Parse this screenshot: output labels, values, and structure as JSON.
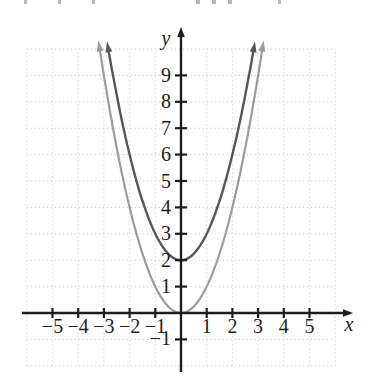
{
  "chart_data": {
    "type": "line",
    "title": "",
    "xlabel": "x",
    "ylabel": "y",
    "xlim": [
      -6,
      6
    ],
    "ylim": [
      -2,
      10
    ],
    "grid": true,
    "grid_color": "#d2d4d1",
    "axis_color": "#1e1e1e",
    "legend": null,
    "x_ticks": [
      {
        "v": -5,
        "label": "−5"
      },
      {
        "v": -4,
        "label": "−4"
      },
      {
        "v": -3,
        "label": "−3"
      },
      {
        "v": -2,
        "label": "−2"
      },
      {
        "v": -1,
        "label": "−1"
      },
      {
        "v": 1,
        "label": "1"
      },
      {
        "v": 2,
        "label": "2"
      },
      {
        "v": 3,
        "label": "3"
      },
      {
        "v": 4,
        "label": "4"
      },
      {
        "v": 5,
        "label": "5"
      }
    ],
    "y_ticks": [
      {
        "v": -1,
        "label": "−1"
      },
      {
        "v": 1,
        "label": "1"
      },
      {
        "v": 2,
        "label": "2"
      },
      {
        "v": 3,
        "label": "3"
      },
      {
        "v": 4,
        "label": "4"
      },
      {
        "v": 5,
        "label": "5"
      },
      {
        "v": 6,
        "label": "6"
      },
      {
        "v": 7,
        "label": "7"
      },
      {
        "v": 8,
        "label": "8"
      },
      {
        "v": 9,
        "label": "9"
      }
    ],
    "series": [
      {
        "name": "y = x²",
        "equation": "y = x^2",
        "color": "#9c9c9c",
        "stroke_width": 2.2,
        "a": 1,
        "c": 0,
        "x_range": [
          -3.16,
          3.16
        ],
        "vertex": {
          "x": 0,
          "y": 0
        },
        "sample_points": {
          "x": [
            -3,
            -2,
            -1,
            0,
            1,
            2,
            3
          ],
          "y": [
            9,
            4,
            1,
            0,
            1,
            4,
            9
          ]
        }
      },
      {
        "name": "y = x² + 2",
        "equation": "y = x^2 + 2",
        "color": "#54565c",
        "stroke_width": 2.4,
        "a": 1,
        "c": 2,
        "x_range": [
          -2.82,
          2.82
        ],
        "vertex": {
          "x": 0,
          "y": 2
        },
        "sample_points": {
          "x": [
            -2,
            -1,
            0,
            1,
            2
          ],
          "y": [
            6,
            3,
            2,
            3,
            6
          ]
        }
      }
    ]
  },
  "artifacts": {
    "top_edge_fragments": [
      {
        "x": 24,
        "w": 3
      },
      {
        "x": 58,
        "w": 3
      },
      {
        "x": 92,
        "w": 3
      },
      {
        "x": 196,
        "w": 4
      },
      {
        "x": 212,
        "w": 4
      },
      {
        "x": 228,
        "w": 4
      },
      {
        "x": 278,
        "w": 3
      }
    ]
  }
}
